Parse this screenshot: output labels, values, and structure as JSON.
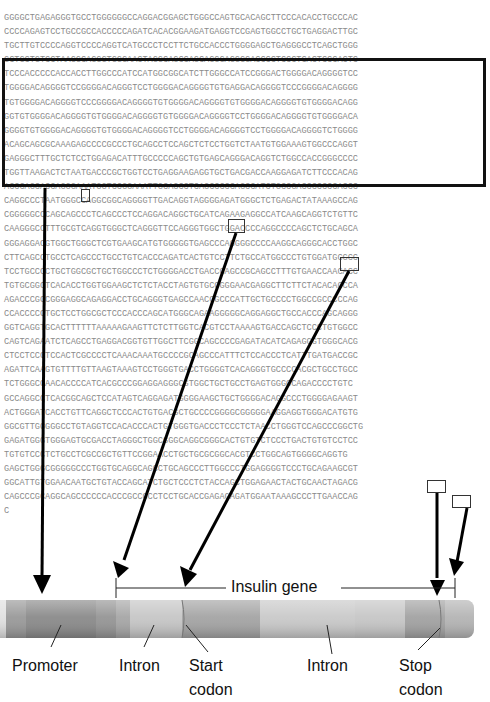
{
  "figure": {
    "sequence_lines": [
      "GGGGCTGAGAGGGTGCCTGGGGGGCCAGGACGGAGCTGGGCCAGTGCACAGCTTCCCACACCTGCCCAC",
      "CCCCAGAGTCCTGCCGCCACCCCCAGATCACACGGAAGATGAGGTCCGAGTGGCCTGCTGAGGACTTGC",
      "TGCTTGTCCCCAGGTCCCCAGGTCATGCCCTCCTTCTGCCACCCTGGGGAGCTGAGGGCCTCAGCTGGG",
      "GCTGCTGTCCTAAGGCAGGGTGGGAACTAGGCAGCCAGCAGGGAGGGGACCCCTCCCTCACTCCCACTC",
      "TCCCACCCCCACCACCTTGGCCCATCCATGGCGGCATCTTGGGCCATCCGGGACTGGGGACAGGGGTCC",
      "TGGGGACAGGGGTCCGGGGACAGGGTCCTGGGGACAGGGGTGTGAGGACAGGGGTCCCGGGGACAGGGG",
      "TGTGGGGACAGGGGTCCCGGGGACAGGGGTGTGGGGACAGGGGTGTGGGGACAGGGGTGTGGGGACAGG",
      "GGTGTGGGGACAGGGGTGTGGGGACAGGGGTGTGGGGACAGGGGTCCTGGGGACAGGGGTGTGGGGACA",
      "GGGGTGTGGGGACAGGGGTGTGGGGACAGGGGTCCTGGGGACAGGGGTCCTGGGGACAGGGGTCTGGGG",
      "ACAGCAGCGCAAAGAGCCCCGCCCTGCAGCCTCCAGCTCTCCTGGTCTAATGTGGAAAGTGGCCCAGGT",
      "GAGGGCTTTGCTCTCCTGGAGACATTTGCCCCCAGCTGTGAGCAGGGACAGGTCTGGCCACCGGGCCCC",
      "TGGTTAAGACTCTAATGACCCGCTGGTCCTGAGGAAGAGGTGCTGACGACCAAGGAGATCTTCCCACAG",
      "ACCCAGCACCAGGGAAATGGTCCGGAAATTGCAGCCTCAGCCCCCAGCCATCTGCCGACCCCCCCACCC",
      "CAGGCCCTAATGGGCCAGGCGGCAGGGGTTGACAGGTAGGGGAGATGGGCTCTGAGACTATAAAGCCAG",
      "CGGGGGCCCAGCAGCCCTCAGCCCTCCAGGACAGGCTGCATCAGAAGAGGCCATCAAGCAGGTCTGTTC",
      "CAAGGGCCTTTGCGTCAGGTGGGCTCAGGGTTCCAGGGTGGCTGGACCCCAGGCCCCAGCTCTGCAGCA",
      "GGGAGGACGTGGCTGGGCTCGTGAAGCATGTGGGGGTGAGCCCAGGGGCCCCAAGGCAGGGCACCTGGC",
      "CTTCAGCCTGCCTCAGCCCTGCCTGTCACCCAGATCACTGTCCTTCTGCCATGGCCCTGTGGATGCGCC",
      "TCCTGCCCCTGCTGGCGCTGCTGGCCCTCTGGGGACCTGACCCAGCCGCAGCCTTTGTGAACCAACACC",
      "TGTGCGGCTCACACCTGGTGGAAGCTCTCTACCTAGTGTGCGGGGAACGAGGCTTCTTCTACACACCCA",
      "AGACCCGCCGGGAGGCAGAGGACCTGCAGGGTGAGCCAACCGCCCATTGCTGCCCCTGGCCGCCCCCAG",
      "CCACCCCCTGCTCCTGGCGCTCCCACCCAGCATGGGCAGAAGGGGGCAGGAGGCTGCCACCCAGCAGGG",
      "GGTCAGGTGCACTTTTTTAAAAAGAAGTTCTCTTGGTCACGTCCTAAAAGTGACCAGCTCCCTGTGGCC",
      "CAGTCAGAATCTCAGCCTGAGGACGGTGTTGGCTTCGGCAGCCCCGAGATACATCAGAGGGTGGGCACG",
      "CTCCTCCCTCCACTCGCCCCTCAAACAAATGCCCCGCAGCCCATTTCTCCACCCTCATTTGATGACCGC",
      "AGATTCAAGTGTTTTGTTAAGTAAAGTCCTGGGTGACCTGGGGTCACAGGGTGCCCCACGCTGCCTGCC",
      "TCTGGGCGAACACCCCATCACGCCCGGAGGAGGGCGTGGCTGCTGCCTGAGTGGGCCAGACCCCTGTC",
      "GCCAGGCCTCACGGCAGCTCCATAGTCAGGAGATGGGGAAGCTGCTGGGGACAGGCCCTGGGGAGAAGT",
      "ACTGGGATCACCTGTTCAGGCTCCCACTGTGACGCTGCCCCGGGGCGGGGGAAGGAGGTGGGACATGTG",
      "GGCGTTGGGGGCCTGTAGGTCCACACCCACTGTGGGTGACCCTCCCTCTAACCTGGGTCCAGCCCGGCTG",
      "GAGATGGGTGGGAGTGCGACCTAGGGCTGGCGGGCAGGCGGGCACTGTGTCTCCCTGACTGTGTCCTCC",
      "TGTGTCCCTCTGCCTCGCCGCTGTTCCGGAACCTGCTGCGCGGCACGTCCTGGCAGTGGGGCAGGTG",
      "GAGCTGGGCGGGGGCCCTGGTGCAGGCAGCCTGCAGCCCTTGGCCCTGGAGGGGTCCCTGCAGAAGCGT",
      "GGCATTGTGGAACAATGCTGTACCAGCATCTGCTCCCTCTACCAGCTGGAGAACTACTGCAACTAGACG",
      "CAGCCCGCAGGCAGCCCCCCACCCGCCGCCTCCTGCACCGAGAGAGATGGAATAAAGCCCTTGAACCAG",
      "C"
    ],
    "gene_span_label": "Insulin gene",
    "labels": {
      "promoter": "Promoter",
      "intron1": "Intron",
      "start_codon_line1": "Start",
      "start_codon_line2": "codon",
      "intron2": "Intron",
      "stop_codon_line1": "Stop",
      "stop_codon_line2": "codon"
    },
    "colors": {
      "sequence_text": "#8a8a8a",
      "box_border": "#111111",
      "bar_dark": "#8c8c8c",
      "bar_mid": "#a8a8a8",
      "bar_light": "#c4c4c4"
    }
  }
}
